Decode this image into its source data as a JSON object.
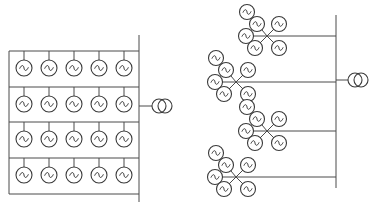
{
  "diagram": {
    "type": "wind-farm collector topologies",
    "colors": {
      "line": "#4a4a4a",
      "symbol": "#3a3a3a",
      "background": "#ffffff"
    },
    "left": {
      "name": "radial-string-layout",
      "rows": 4,
      "generators_per_row": 5,
      "row_tops": [
        51,
        87,
        122,
        158
      ],
      "frame": {
        "x1": 9,
        "x2": 139,
        "bottom": 194
      },
      "gen_x": [
        24,
        49,
        74,
        99,
        124
      ],
      "gen_radius": 8,
      "bus": {
        "x": 139,
        "y1": 35,
        "y2": 202
      },
      "transformer": {
        "x": 162,
        "y": 106,
        "link_from": 139
      }
    },
    "right": {
      "name": "star-cluster-layout",
      "bus": {
        "x": 336,
        "y1": 15,
        "y2": 188
      },
      "gen_radius": 7.5,
      "spoke": 17,
      "feeders": [
        {
          "y": 36,
          "hub_x": 267,
          "generators": 6
        },
        {
          "y": 82,
          "hub_x": 236,
          "generators": 6
        },
        {
          "y": 131,
          "hub_x": 267,
          "generators": 6
        },
        {
          "y": 177,
          "hub_x": 236,
          "generators": 6
        }
      ],
      "transformer": {
        "x": 358,
        "y": 80,
        "link_from": 336
      }
    },
    "symbols": {
      "generator": "circle-with-tilde (AC generator)",
      "transformer": "two-overlapping-circles"
    }
  }
}
